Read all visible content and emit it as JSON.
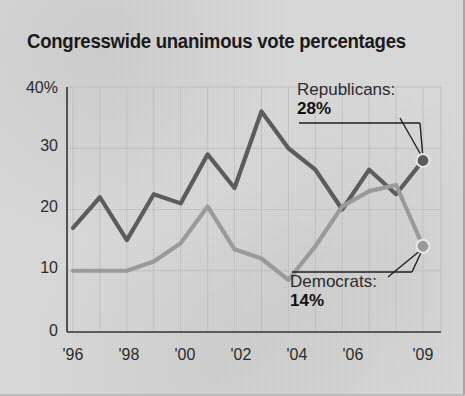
{
  "title": "Congresswide unanimous vote percentages",
  "axes": {
    "y_ticks": [
      "40%",
      "30",
      "20",
      "10",
      "0"
    ],
    "x_ticks": [
      "'96",
      "'98",
      "'00",
      "'02",
      "'04",
      "'06",
      "'09"
    ]
  },
  "callouts": {
    "republicans": {
      "name": "Republicans:",
      "value": "28%"
    },
    "democrats": {
      "name": "Democrats:",
      "value": "14%"
    }
  },
  "colors": {
    "republican_line": "#5c5c5c",
    "democrat_line": "#9a9a9a",
    "background": "#dcdcdc",
    "grid": "#c0c0c0",
    "axis": "#333333",
    "text": "#2b2b2b"
  },
  "chart_data": {
    "type": "line",
    "title": "Congresswide unanimous vote percentages",
    "xlabel": "",
    "ylabel": "",
    "ylim": [
      0,
      40
    ],
    "grid": true,
    "legend": "annotations",
    "x": [
      1996,
      1997,
      1998,
      1999,
      2000,
      2001,
      2002,
      2003,
      2004,
      2005,
      2006,
      2007,
      2008,
      2009
    ],
    "x_tick_labels": [
      "'96",
      "'98",
      "'00",
      "'02",
      "'04",
      "'06",
      "'09"
    ],
    "x_tick_values": [
      1996,
      1998,
      2000,
      2002,
      2004,
      2006,
      2009
    ],
    "y_tick_values": [
      0,
      10,
      20,
      30,
      40
    ],
    "y_tick_labels": [
      "0",
      "10",
      "20",
      "30",
      "40%"
    ],
    "series": [
      {
        "name": "Republicans",
        "color": "#5c5c5c",
        "values": [
          17,
          22,
          15,
          22.5,
          21,
          29,
          23.5,
          36,
          30,
          26.5,
          20,
          26.5,
          22.5,
          28
        ],
        "end_label": "28%",
        "end_point": {
          "x": 2009,
          "y": 28
        }
      },
      {
        "name": "Democrats",
        "color": "#9a9a9a",
        "values": [
          10,
          10,
          10,
          11.5,
          14.5,
          20.5,
          13.5,
          12,
          8.5,
          14,
          20.5,
          23,
          24,
          14
        ],
        "end_label": "14%",
        "end_point": {
          "x": 2009,
          "y": 14
        }
      }
    ],
    "annotations": [
      {
        "text": "Republicans: 28%",
        "points_to": {
          "x": 2009,
          "y": 28
        }
      },
      {
        "text": "Democrats: 14%",
        "points_to": {
          "x": 2009,
          "y": 14
        }
      }
    ]
  }
}
